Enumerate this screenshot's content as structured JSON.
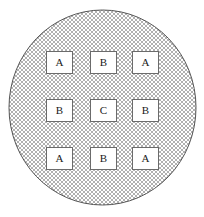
{
  "figure": {
    "background_color": "#ffffff",
    "canvas": {
      "width": 204,
      "height": 217
    }
  },
  "circle": {
    "name": "hatched-circle",
    "center_x": 102.5,
    "center_y": 107.5,
    "radius_x": 93.5,
    "radius_y": 97.5,
    "stroke_color": "#555555",
    "stroke_width": 1,
    "fill_pattern": "cross-hatch",
    "fill_color": "#ffffff",
    "hatch_color": "#b4b4b4",
    "hatch_spacing": 2
  },
  "grid": {
    "rows": 3,
    "columns": 3,
    "cell_width": 27,
    "cell_height": 23,
    "column_x": [
      46,
      90,
      132
    ],
    "row_y": [
      51,
      99,
      147
    ],
    "box_fill": "#ffffff",
    "box_stroke": "#6b6b6b",
    "cells": [
      {
        "id": "cell-r1c1",
        "row": 1,
        "col": 1,
        "label": "A"
      },
      {
        "id": "cell-r1c2",
        "row": 1,
        "col": 2,
        "label": "B"
      },
      {
        "id": "cell-r1c3",
        "row": 1,
        "col": 3,
        "label": "A"
      },
      {
        "id": "cell-r2c1",
        "row": 2,
        "col": 1,
        "label": "B"
      },
      {
        "id": "cell-r2c2",
        "row": 2,
        "col": 2,
        "label": "C"
      },
      {
        "id": "cell-r2c3",
        "row": 2,
        "col": 3,
        "label": "B"
      },
      {
        "id": "cell-r3c1",
        "row": 3,
        "col": 1,
        "label": "A"
      },
      {
        "id": "cell-r3c2",
        "row": 3,
        "col": 2,
        "label": "B"
      },
      {
        "id": "cell-r3c3",
        "row": 3,
        "col": 3,
        "label": "A"
      }
    ]
  }
}
